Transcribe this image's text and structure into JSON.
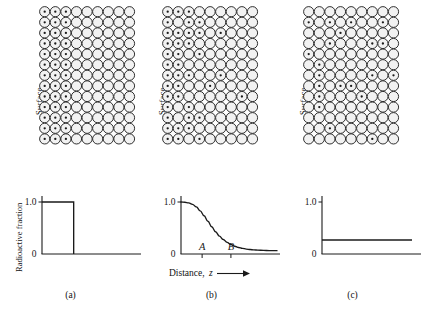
{
  "figure": {
    "background": "#ffffff",
    "ink": "#1a1a1a"
  },
  "labels": {
    "surface": "Surface",
    "y_axis": "Radioactive fraction",
    "x_axis_prefix": "Distance,",
    "x_axis_variable": "z",
    "tick_high": "1.0",
    "tick_zero": "0",
    "marker_a": "A",
    "marker_b": "B"
  },
  "panels": [
    {
      "id": "a",
      "caption": "(a)",
      "surface_label": "Surface",
      "lattice": {
        "columns": 9,
        "rows": 13,
        "spacing": 10.6,
        "radius": 5.1,
        "dot_radius": 1.15,
        "fill": "#f2f2f2",
        "stroke": "#1a1a1a",
        "pattern": "block",
        "labeled_columns": 3,
        "description": "Left three columns fully labeled with tracer atoms; remainder unlabeled"
      },
      "plot": {
        "type": "step",
        "y_label": "Radioactive fraction",
        "has_y_label": true,
        "ylim": [
          0,
          1.15
        ],
        "xlim": [
          0,
          1
        ],
        "ticks_y": [
          "1.0",
          "0"
        ],
        "step_level": 1.0,
        "step_edge_x": 0.33,
        "tail_level": 0.0
      }
    },
    {
      "id": "b",
      "caption": "(b)",
      "surface_label": "Surface",
      "lattice": {
        "columns": 9,
        "rows": 13,
        "spacing": 10.6,
        "radius": 5.1,
        "dot_radius": 1.15,
        "fill": "#f2f2f2",
        "stroke": "#1a1a1a",
        "pattern": "gradient",
        "description": "Tracer atom density decays with depth from the surface"
      },
      "plot": {
        "type": "line",
        "has_y_label": false,
        "ylim": [
          0,
          1.15
        ],
        "xlim": [
          0,
          1
        ],
        "ticks_y": [
          "1.0",
          "0"
        ],
        "x_label": "Distance,  z",
        "markers": [
          {
            "label": "A",
            "x": 0.22
          },
          {
            "label": "B",
            "x": 0.52
          }
        ],
        "curve_points": [
          [
            0.0,
            1.0
          ],
          [
            0.04,
            0.995
          ],
          [
            0.08,
            0.982
          ],
          [
            0.12,
            0.955
          ],
          [
            0.16,
            0.905
          ],
          [
            0.2,
            0.83
          ],
          [
            0.24,
            0.735
          ],
          [
            0.28,
            0.63
          ],
          [
            0.32,
            0.525
          ],
          [
            0.36,
            0.428
          ],
          [
            0.4,
            0.345
          ],
          [
            0.44,
            0.278
          ],
          [
            0.48,
            0.224
          ],
          [
            0.52,
            0.182
          ],
          [
            0.56,
            0.15
          ],
          [
            0.6,
            0.126
          ],
          [
            0.64,
            0.108
          ],
          [
            0.68,
            0.095
          ],
          [
            0.72,
            0.086
          ],
          [
            0.76,
            0.079
          ],
          [
            0.8,
            0.074
          ],
          [
            0.86,
            0.069
          ],
          [
            0.92,
            0.066
          ],
          [
            1.0,
            0.064
          ]
        ]
      }
    },
    {
      "id": "c",
      "caption": "(c)",
      "surface_label": "Surface",
      "lattice": {
        "columns": 9,
        "rows": 13,
        "spacing": 10.6,
        "radius": 5.1,
        "dot_radius": 1.15,
        "fill": "#f2f2f2",
        "stroke": "#1a1a1a",
        "pattern": "uniform",
        "density": 0.25,
        "description": "Tracer atoms uniformly distributed at low density"
      },
      "plot": {
        "type": "flat",
        "has_y_label": false,
        "ylim": [
          0,
          1.15
        ],
        "xlim": [
          0,
          1
        ],
        "ticks_y": [
          "1.0",
          "0"
        ],
        "flat_level": 0.27
      }
    }
  ],
  "chart_data": {
    "type": "line",
    "xlabel": "Distance, z",
    "ylabel": "Radioactive fraction",
    "ylim": [
      0,
      1.0
    ],
    "xlim": [
      0,
      1.0
    ],
    "grid": false,
    "legend": "none",
    "subplots": [
      {
        "caption": "(a)",
        "type": "step",
        "description": "Sharp interface: radioactive fraction is 1.0 up to the boundary then drops to 0",
        "x": [
          0.0,
          0.33,
          0.33,
          1.0
        ],
        "y": [
          1.0,
          1.0,
          0.0,
          0.0
        ],
        "yticks": [
          0,
          1.0
        ],
        "yticklabels": [
          "0",
          "1.0"
        ]
      },
      {
        "caption": "(b)",
        "type": "line",
        "description": "Diffused profile: sigmoidal decay of radioactive fraction with depth",
        "x": [
          0.0,
          0.04,
          0.08,
          0.12,
          0.16,
          0.2,
          0.24,
          0.28,
          0.32,
          0.36,
          0.4,
          0.44,
          0.48,
          0.52,
          0.56,
          0.6,
          0.64,
          0.68,
          0.72,
          0.76,
          0.8,
          0.86,
          0.92,
          1.0
        ],
        "y": [
          1.0,
          0.995,
          0.982,
          0.955,
          0.905,
          0.83,
          0.735,
          0.63,
          0.525,
          0.428,
          0.345,
          0.278,
          0.224,
          0.182,
          0.15,
          0.126,
          0.108,
          0.095,
          0.086,
          0.079,
          0.074,
          0.069,
          0.066,
          0.064
        ],
        "yticks": [
          0,
          1.0
        ],
        "yticklabels": [
          "0",
          "1.0"
        ],
        "annotations": [
          {
            "text": "A",
            "x": 0.22,
            "y": 0.0
          },
          {
            "text": "B",
            "x": 0.52,
            "y": 0.0
          }
        ]
      },
      {
        "caption": "(c)",
        "type": "line",
        "description": "Fully homogenised: constant low radioactive fraction at all depths",
        "x": [
          0.0,
          1.0
        ],
        "y": [
          0.27,
          0.27
        ],
        "yticks": [
          0,
          1.0
        ],
        "yticklabels": [
          "0",
          "1.0"
        ]
      }
    ]
  }
}
